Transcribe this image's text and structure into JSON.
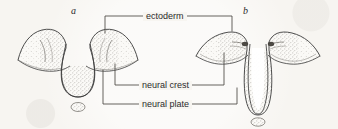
{
  "figure": {
    "type": "line-diagram",
    "background_color": "#f7f5f1",
    "ink_color": "#3a3a3a",
    "panels": [
      {
        "id": "a",
        "letter": "a",
        "stage": "neural-plate-folding"
      },
      {
        "id": "b",
        "letter": "b",
        "stage": "neural-groove-deepening"
      }
    ],
    "labels": [
      {
        "id": "ectoderm",
        "text": "ectoderm"
      },
      {
        "id": "neural_crest",
        "text": "neural crest"
      },
      {
        "id": "neural_plate",
        "text": "neural plate"
      }
    ]
  }
}
